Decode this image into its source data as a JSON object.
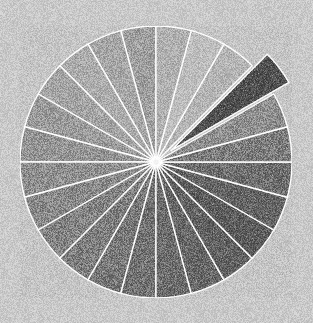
{
  "figure": {
    "background_color": "#c9c9c9",
    "width": 313,
    "height": 323,
    "title": "",
    "has_noise_texture": true,
    "noise_description": "speckled film-grain noise over entire image"
  },
  "chart_data": {
    "type": "pie",
    "title": "",
    "xlabel": "",
    "ylabel": "",
    "legend": "none",
    "grid": false,
    "center_x": 156,
    "center_y": 162,
    "radius": 136,
    "start_angle_deg": 90,
    "direction": "counterclockwise",
    "wedge_edge_color": "#ffffff",
    "wedge_edge_width": 1.4,
    "exploded_index": 20,
    "explode_distance": 0.14,
    "categories": [
      "S1",
      "S2",
      "S3",
      "S4",
      "S5",
      "S6",
      "S7",
      "S8",
      "S9",
      "S10",
      "S11",
      "S12",
      "S13",
      "S14",
      "S15",
      "S16",
      "S17",
      "S18",
      "S19",
      "S20",
      "S21",
      "S22",
      "S23",
      "S24"
    ],
    "values": [
      4.1667,
      4.1667,
      4.1667,
      4.1667,
      4.1667,
      4.1667,
      4.1667,
      4.1667,
      4.1667,
      4.1667,
      4.1667,
      4.1667,
      4.1667,
      4.1667,
      4.1667,
      4.1667,
      4.1667,
      4.1667,
      4.1667,
      4.1667,
      4.1667,
      4.1667,
      4.1667,
      4.1667
    ],
    "colors": [
      "#9e9e9e",
      "#a6a6a6",
      "#acacac",
      "#a3a3a3",
      "#9a9a9a",
      "#939393",
      "#8d8d8d",
      "#878787",
      "#818181",
      "#7b7b7b",
      "#757575",
      "#6f6f6f",
      "#696969",
      "#636363",
      "#5d5d5d",
      "#585858",
      "#5f5f5f",
      "#6b6b6b",
      "#7a7a7a",
      "#8d8d8d",
      "#4a4a4a",
      "#b4b4b4",
      "#bdbdbd",
      "#b0b0b0"
    ],
    "colormap": "gray"
  }
}
